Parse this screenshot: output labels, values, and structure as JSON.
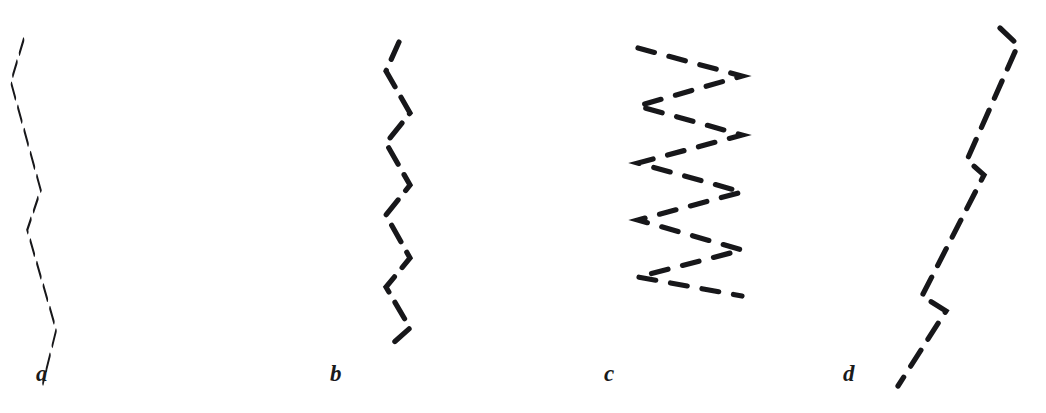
{
  "figure": {
    "background_color": "#ffffff",
    "stroke_color": "#17171a",
    "width": 1046,
    "height": 413
  },
  "panels": [
    {
      "id": "panel-a",
      "label": "a",
      "label_x": 36,
      "label_y": 362,
      "description": "wide low-frequency zigzag descending with large amplitude",
      "stroke_width": 5.2,
      "dash_pattern": "19 13",
      "points": "82,40 38,82 142,190 95,230 196,330 150,383"
    },
    {
      "id": "panel-b",
      "label": "b",
      "label_x": 330,
      "label_y": 362,
      "description": "narrow high-frequency vertical zigzag, small amplitude",
      "stroke_width": 5.2,
      "dash_pattern": "19 12",
      "points": "399,42 386,71 410,113 386,143 410,185 386,215 410,258 386,287 410,328 392,344"
    },
    {
      "id": "panel-c",
      "label": "c",
      "label_x": 604,
      "label_y": 362,
      "description": "flat wide-amplitude zigzag with very short vertical period",
      "stroke_width": 5.2,
      "dash_pattern": "17 15",
      "points": "638,48 742,76 638,106 742,135 638,163 742,192 638,220 742,250 638,277 742,296"
    },
    {
      "id": "panel-d",
      "label": "d",
      "label_x": 843,
      "label_y": 362,
      "description": "near-straight steep diagonal with two small reversal notches",
      "stroke_width": 5.2,
      "dash_pattern": "19 13",
      "points": "1000,28 1018,45 967,160 984,175 922,296 946,311 898,386"
    }
  ],
  "chart_data": {
    "type": "line",
    "xlabel": "",
    "ylabel": "",
    "grid": false,
    "legend": "none",
    "xlim": [
      0,
      1046
    ],
    "ylim": [
      413,
      0
    ],
    "series": [
      {
        "name": "a",
        "style": "dashed",
        "color": "#17171a",
        "x": [
          82,
          38,
          142,
          95,
          196,
          150
        ],
        "y": [
          40,
          82,
          190,
          230,
          330,
          383
        ]
      },
      {
        "name": "b",
        "style": "dashed",
        "color": "#17171a",
        "x": [
          399,
          386,
          410,
          386,
          410,
          386,
          410,
          386,
          410,
          392
        ],
        "y": [
          42,
          71,
          113,
          143,
          185,
          215,
          258,
          287,
          328,
          344
        ]
      },
      {
        "name": "c",
        "style": "dashed",
        "color": "#17171a",
        "x": [
          638,
          742,
          638,
          742,
          638,
          742,
          638,
          742,
          638,
          742
        ],
        "y": [
          48,
          76,
          106,
          135,
          163,
          192,
          220,
          250,
          277,
          296
        ]
      },
      {
        "name": "d",
        "style": "dashed",
        "color": "#17171a",
        "x": [
          1000,
          1018,
          967,
          984,
          922,
          946,
          898
        ],
        "y": [
          28,
          45,
          160,
          175,
          296,
          311,
          386
        ]
      }
    ]
  }
}
